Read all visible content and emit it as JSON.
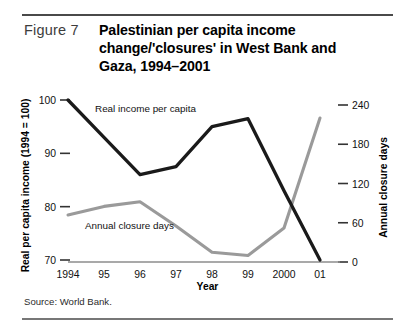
{
  "figure": {
    "label": "Figure 7",
    "title": "Palestinian per capita income change/'closures' in West Bank and Gaza, 1994–2001",
    "source": "Source: World Bank."
  },
  "chart_data": {
    "type": "line",
    "title": "Palestinian per capita income change/'closures' in West Bank and Gaza, 1994–2001",
    "xlabel": "Year",
    "ylabel": "Real per capita income (1994 = 100)",
    "ylabel_right": "Annual closure days",
    "categories": [
      "1994",
      "95",
      "96",
      "97",
      "98",
      "99",
      "2000",
      "01"
    ],
    "x_tick_labels": [
      "1994",
      "95",
      "96",
      "97",
      "98",
      "99",
      "2000",
      "01"
    ],
    "ylim": [
      70,
      100
    ],
    "y_ticks": [
      70,
      80,
      90,
      100
    ],
    "y_tick_labels": [
      "70",
      "80",
      "90",
      "100"
    ],
    "ylim_right": [
      0,
      240
    ],
    "y_ticks_right": [
      0,
      60,
      120,
      180,
      240
    ],
    "y_tick_labels_right": [
      "0",
      "60",
      "120",
      "180",
      "240"
    ],
    "grid": false,
    "legend": "inline-annotations",
    "series": [
      {
        "name": "Real income per capita",
        "axis": "left",
        "color": "#1a1a1a",
        "values": [
          100,
          93,
          86,
          87.5,
          95,
          96.5,
          83,
          70
        ]
      },
      {
        "name": "Annual closure days",
        "axis": "right",
        "color": "#9a9a9a",
        "values": [
          72,
          85,
          92,
          55,
          15,
          10,
          52,
          220
        ]
      }
    ],
    "annotations": [
      {
        "text": "Real income per capita",
        "series": "Real income per capita"
      },
      {
        "text": "Annual closure days",
        "series": "Annual closure days"
      }
    ]
  }
}
